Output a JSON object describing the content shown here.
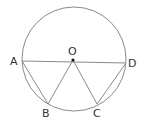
{
  "diagram": {
    "type": "circle-geometry",
    "circle": {
      "cx": 74,
      "cy": 59,
      "r": 52,
      "stroke": "#8a8a8a"
    },
    "points": {
      "A": {
        "label": "A",
        "x": 22,
        "y": 61
      },
      "O": {
        "label": "O",
        "x": 73,
        "y": 60
      },
      "D": {
        "label": "D",
        "x": 126,
        "y": 63
      },
      "B": {
        "label": "B",
        "x": 48,
        "y": 104
      },
      "C": {
        "label": "C",
        "x": 97,
        "y": 104
      }
    },
    "segments": [
      "AD",
      "AB",
      "OB",
      "OC",
      "CD"
    ],
    "line_color": "#8a8a8a",
    "center_dot_color": "#111111"
  }
}
